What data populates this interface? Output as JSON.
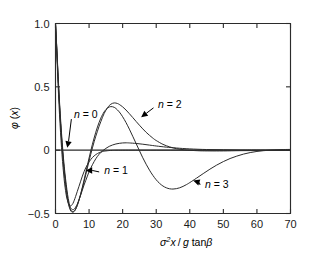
{
  "chart_data": {
    "type": "line",
    "title": "",
    "xlabel": "σ²x / g tanβ",
    "ylabel": "φ (x)",
    "xlim": [
      0,
      70
    ],
    "ylim": [
      -0.5,
      1.0
    ],
    "xticks": [
      0,
      10,
      20,
      30,
      40,
      50,
      60,
      70
    ],
    "yticks": [
      -0.5,
      0,
      0.5,
      1.0
    ],
    "xtick_labels": [
      "0",
      "10",
      "20",
      "30",
      "40",
      "50",
      "60",
      "70"
    ],
    "ytick_labels": [
      "−0.5",
      "0",
      "0.5",
      "1.0"
    ],
    "grid": false,
    "legend": "inline-annotations",
    "zero_line": true,
    "annotations": [
      {
        "text": "n = 0",
        "x_data": 5.5,
        "y_data": 0.28,
        "points_to_x": 3.5,
        "points_to_y": 0.02
      },
      {
        "text": "n = 1",
        "x_data": 14.5,
        "y_data": -0.16,
        "points_to_x": 9.0,
        "points_to_y": -0.16
      },
      {
        "text": "n = 2",
        "x_data": 30.5,
        "y_data": 0.36,
        "points_to_x": 25.5,
        "points_to_y": 0.26
      },
      {
        "text": "n = 3",
        "x_data": 44.5,
        "y_data": -0.27,
        "points_to_x": 41.0,
        "points_to_y": -0.24
      }
    ],
    "series": [
      {
        "name": "n = 0",
        "label": "n = 0",
        "color": "#2b2b2b",
        "points": [
          [
            0,
            1.0
          ],
          [
            0.3,
            0.82
          ],
          [
            0.6,
            0.62
          ],
          [
            0.9,
            0.44
          ],
          [
            1.2,
            0.28
          ],
          [
            1.5,
            0.14
          ],
          [
            1.8,
            0.02
          ],
          [
            2.1,
            -0.09
          ],
          [
            2.4,
            -0.18
          ],
          [
            2.7,
            -0.26
          ],
          [
            3.0,
            -0.32
          ],
          [
            3.3,
            -0.37
          ],
          [
            3.6,
            -0.4
          ],
          [
            3.9,
            -0.425
          ],
          [
            4.2,
            -0.44
          ],
          [
            4.5,
            -0.44
          ],
          [
            4.8,
            -0.435
          ],
          [
            5.2,
            -0.42
          ],
          [
            5.6,
            -0.395
          ],
          [
            6.0,
            -0.365
          ],
          [
            6.5,
            -0.325
          ],
          [
            7.0,
            -0.285
          ],
          [
            7.5,
            -0.245
          ],
          [
            8.0,
            -0.205
          ],
          [
            8.5,
            -0.17
          ],
          [
            9.0,
            -0.14
          ],
          [
            9.5,
            -0.115
          ],
          [
            10.0,
            -0.092
          ],
          [
            11.0,
            -0.058
          ],
          [
            12.0,
            -0.035
          ],
          [
            13.0,
            -0.02
          ],
          [
            14.0,
            -0.011
          ],
          [
            15.0,
            -0.006
          ],
          [
            17.0,
            -0.001
          ],
          [
            20.0,
            0.0
          ],
          [
            30.0,
            0.0
          ],
          [
            50.0,
            0.0
          ],
          [
            70.0,
            0.0
          ]
        ]
      },
      {
        "name": "n = 1",
        "label": "n = 1",
        "color": "#2b2b2b",
        "points": [
          [
            0,
            1.0
          ],
          [
            0.4,
            0.8
          ],
          [
            0.8,
            0.58
          ],
          [
            1.2,
            0.38
          ],
          [
            1.6,
            0.21
          ],
          [
            2.0,
            0.06
          ],
          [
            2.4,
            -0.07
          ],
          [
            2.8,
            -0.18
          ],
          [
            3.2,
            -0.27
          ],
          [
            3.6,
            -0.35
          ],
          [
            4.0,
            -0.41
          ],
          [
            4.4,
            -0.45
          ],
          [
            4.8,
            -0.465
          ],
          [
            5.2,
            -0.47
          ],
          [
            5.6,
            -0.465
          ],
          [
            6.0,
            -0.45
          ],
          [
            6.5,
            -0.425
          ],
          [
            7.0,
            -0.39
          ],
          [
            7.5,
            -0.355
          ],
          [
            8.0,
            -0.315
          ],
          [
            8.5,
            -0.275
          ],
          [
            9.0,
            -0.24
          ],
          [
            9.5,
            -0.205
          ],
          [
            10.0,
            -0.17
          ],
          [
            11.0,
            -0.115
          ],
          [
            12.0,
            -0.068
          ],
          [
            13.0,
            -0.032
          ],
          [
            14.0,
            -0.006
          ],
          [
            15.0,
            0.014
          ],
          [
            16.0,
            0.03
          ],
          [
            17.0,
            0.041
          ],
          [
            18.0,
            0.049
          ],
          [
            19.0,
            0.054
          ],
          [
            20.0,
            0.057
          ],
          [
            21.0,
            0.058
          ],
          [
            22.0,
            0.057
          ],
          [
            24.0,
            0.053
          ],
          [
            26.0,
            0.047
          ],
          [
            28.0,
            0.04
          ],
          [
            30.0,
            0.033
          ],
          [
            33.0,
            0.024
          ],
          [
            36.0,
            0.017
          ],
          [
            40.0,
            0.01
          ],
          [
            45.0,
            0.005
          ],
          [
            50.0,
            0.003
          ],
          [
            55.0,
            0.001
          ],
          [
            60.0,
            0.001
          ],
          [
            70.0,
            0.0
          ]
        ]
      },
      {
        "name": "n = 2",
        "label": "n = 2",
        "color": "#2b2b2b",
        "points": [
          [
            0,
            1.0
          ],
          [
            0.4,
            0.79
          ],
          [
            0.8,
            0.56
          ],
          [
            1.2,
            0.36
          ],
          [
            1.6,
            0.18
          ],
          [
            2.0,
            0.03
          ],
          [
            2.4,
            -0.1
          ],
          [
            2.8,
            -0.21
          ],
          [
            3.2,
            -0.3
          ],
          [
            3.6,
            -0.38
          ],
          [
            4.0,
            -0.43
          ],
          [
            4.4,
            -0.465
          ],
          [
            4.8,
            -0.48
          ],
          [
            5.2,
            -0.485
          ],
          [
            5.6,
            -0.48
          ],
          [
            6.0,
            -0.465
          ],
          [
            6.5,
            -0.435
          ],
          [
            7.0,
            -0.395
          ],
          [
            7.5,
            -0.35
          ],
          [
            8.0,
            -0.3
          ],
          [
            8.5,
            -0.25
          ],
          [
            9.0,
            -0.195
          ],
          [
            9.5,
            -0.14
          ],
          [
            10.0,
            -0.085
          ],
          [
            10.5,
            -0.032
          ],
          [
            11.0,
            0.018
          ],
          [
            11.5,
            0.066
          ],
          [
            12.0,
            0.11
          ],
          [
            12.5,
            0.15
          ],
          [
            13.0,
            0.19
          ],
          [
            13.5,
            0.225
          ],
          [
            14.0,
            0.26
          ],
          [
            14.5,
            0.29
          ],
          [
            15.0,
            0.315
          ],
          [
            15.5,
            0.335
          ],
          [
            16.0,
            0.352
          ],
          [
            16.5,
            0.363
          ],
          [
            17.0,
            0.37
          ],
          [
            17.5,
            0.373
          ],
          [
            18.0,
            0.372
          ],
          [
            18.5,
            0.368
          ],
          [
            19.0,
            0.361
          ],
          [
            20.0,
            0.342
          ],
          [
            21.0,
            0.317
          ],
          [
            22.0,
            0.288
          ],
          [
            23.0,
            0.258
          ],
          [
            24.0,
            0.227
          ],
          [
            25.0,
            0.197
          ],
          [
            26.0,
            0.168
          ],
          [
            27.0,
            0.141
          ],
          [
            28.0,
            0.117
          ],
          [
            29.0,
            0.095
          ],
          [
            30.0,
            0.076
          ],
          [
            32.0,
            0.046
          ],
          [
            34.0,
            0.026
          ],
          [
            36.0,
            0.012
          ],
          [
            38.0,
            0.004
          ],
          [
            40.0,
            -0.001
          ],
          [
            43.0,
            -0.005
          ],
          [
            46.0,
            -0.006
          ],
          [
            50.0,
            -0.006
          ],
          [
            55.0,
            -0.004
          ],
          [
            60.0,
            -0.003
          ],
          [
            65.0,
            -0.002
          ],
          [
            70.0,
            -0.001
          ]
        ]
      },
      {
        "name": "n = 3",
        "label": "n = 3",
        "color": "#2b2b2b",
        "points": [
          [
            0,
            1.0
          ],
          [
            0.4,
            0.785
          ],
          [
            0.8,
            0.555
          ],
          [
            1.2,
            0.35
          ],
          [
            1.6,
            0.17
          ],
          [
            2.0,
            0.02
          ],
          [
            2.4,
            -0.11
          ],
          [
            2.8,
            -0.22
          ],
          [
            3.2,
            -0.315
          ],
          [
            3.6,
            -0.39
          ],
          [
            4.0,
            -0.44
          ],
          [
            4.4,
            -0.472
          ],
          [
            4.8,
            -0.487
          ],
          [
            5.2,
            -0.49
          ],
          [
            5.6,
            -0.483
          ],
          [
            6.0,
            -0.467
          ],
          [
            6.5,
            -0.435
          ],
          [
            7.0,
            -0.393
          ],
          [
            7.5,
            -0.345
          ],
          [
            8.0,
            -0.292
          ],
          [
            8.5,
            -0.236
          ],
          [
            9.0,
            -0.178
          ],
          [
            9.5,
            -0.12
          ],
          [
            10.0,
            -0.062
          ],
          [
            10.5,
            -0.006
          ],
          [
            11.0,
            0.047
          ],
          [
            11.5,
            0.096
          ],
          [
            12.0,
            0.142
          ],
          [
            12.5,
            0.183
          ],
          [
            13.0,
            0.22
          ],
          [
            13.5,
            0.253
          ],
          [
            14.0,
            0.28
          ],
          [
            14.5,
            0.303
          ],
          [
            15.0,
            0.32
          ],
          [
            15.5,
            0.333
          ],
          [
            16.0,
            0.341
          ],
          [
            16.5,
            0.344
          ],
          [
            17.0,
            0.343
          ],
          [
            17.5,
            0.338
          ],
          [
            18.0,
            0.329
          ],
          [
            19.0,
            0.302
          ],
          [
            20.0,
            0.264
          ],
          [
            21.0,
            0.218
          ],
          [
            22.0,
            0.166
          ],
          [
            23.0,
            0.11
          ],
          [
            24.0,
            0.053
          ],
          [
            25.0,
            -0.004
          ],
          [
            26.0,
            -0.06
          ],
          [
            27.0,
            -0.111
          ],
          [
            28.0,
            -0.158
          ],
          [
            29.0,
            -0.199
          ],
          [
            30.0,
            -0.234
          ],
          [
            31.0,
            -0.262
          ],
          [
            32.0,
            -0.283
          ],
          [
            33.0,
            -0.297
          ],
          [
            34.0,
            -0.305
          ],
          [
            35.0,
            -0.307
          ],
          [
            36.0,
            -0.304
          ],
          [
            37.0,
            -0.297
          ],
          [
            38.0,
            -0.286
          ],
          [
            39.0,
            -0.272
          ],
          [
            40.0,
            -0.256
          ],
          [
            42.0,
            -0.221
          ],
          [
            44.0,
            -0.185
          ],
          [
            46.0,
            -0.15
          ],
          [
            48.0,
            -0.118
          ],
          [
            50.0,
            -0.09
          ],
          [
            52.0,
            -0.066
          ],
          [
            54.0,
            -0.047
          ],
          [
            56.0,
            -0.031
          ],
          [
            58.0,
            -0.019
          ],
          [
            60.0,
            -0.01
          ],
          [
            62.0,
            -0.004
          ],
          [
            64.0,
            0.0
          ],
          [
            66.0,
            0.003
          ],
          [
            68.0,
            0.005
          ],
          [
            70.0,
            0.006
          ]
        ]
      }
    ]
  }
}
